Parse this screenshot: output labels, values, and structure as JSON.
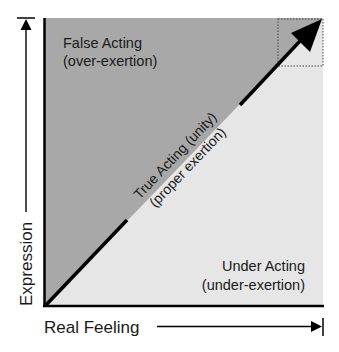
{
  "diagram": {
    "axes": {
      "x_label": "Real Feeling",
      "y_label": "Expression"
    },
    "regions": {
      "upper": {
        "title": "False Acting",
        "subtitle": "(over-exertion)",
        "color": "#a8a8a8"
      },
      "lower": {
        "title": "Under Acting",
        "subtitle": "(under-exertion)",
        "color": "#e6e6e6"
      }
    },
    "diagonal": {
      "title": "True Acting (unity)",
      "subtitle": "(proper exertion)"
    },
    "colors": {
      "line": "#000000",
      "text": "#1a1a1a",
      "dotted_box": "#444444"
    }
  }
}
